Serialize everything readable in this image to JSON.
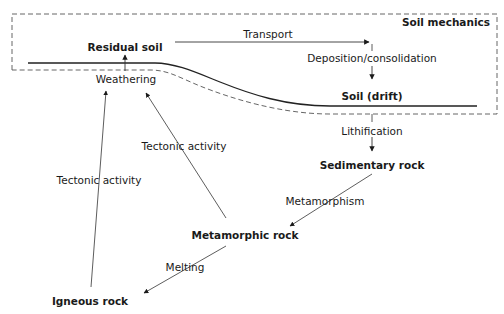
{
  "diagram": {
    "region_label": "Soil mechanics",
    "nodes": {
      "residual_soil": "Residual soil",
      "soil_drift": "Soil (drift)",
      "sedimentary_rock": "Sedimentary rock",
      "metamorphic_rock": "Metamorphic rock",
      "igneous_rock": "Igneous rock"
    },
    "processes": {
      "transport": "Transport",
      "deposition": "Deposition/consolidation",
      "weathering": "Weathering",
      "lithification": "Lithification",
      "metamorphism": "Metamorphism",
      "melting": "Melting",
      "tectonic_left": "Tectonic activity",
      "tectonic_mid": "Tectonic activity"
    },
    "edges": [
      {
        "from": "Residual soil",
        "to": "Soil (drift)",
        "label": "Transport"
      },
      {
        "from": "Transport",
        "to": "Soil (drift)",
        "label": "Deposition/consolidation"
      },
      {
        "from": "Weathering",
        "to": "Residual soil",
        "label": ""
      },
      {
        "from": "Soil (drift)",
        "to": "Sedimentary rock",
        "label": "Lithification"
      },
      {
        "from": "Sedimentary rock",
        "to": "Metamorphic rock",
        "label": "Metamorphism"
      },
      {
        "from": "Metamorphic rock",
        "to": "Igneous rock",
        "label": "Melting"
      },
      {
        "from": "Igneous rock",
        "to": "Weathering",
        "label": "Tectonic activity"
      },
      {
        "from": "Metamorphic rock",
        "to": "Weathering",
        "label": "Tectonic activity"
      }
    ],
    "colors": {
      "line": "#333333",
      "text": "#1a1a1a",
      "dash": "#555555"
    }
  }
}
